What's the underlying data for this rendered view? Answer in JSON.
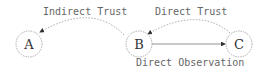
{
  "diagram": {
    "nodes": [
      {
        "id": "A",
        "label": "A"
      },
      {
        "id": "B",
        "label": "B"
      },
      {
        "id": "C",
        "label": "C"
      }
    ],
    "edges": [
      {
        "from": "B",
        "to": "A",
        "label": "Indirect Trust",
        "style": "dashed-curve"
      },
      {
        "from": "C",
        "to": "B",
        "label": "Direct Trust",
        "style": "dashed-curve"
      },
      {
        "from": "B",
        "to": "C",
        "label": "Direct Observation",
        "style": "solid"
      }
    ],
    "colors": {
      "stroke": "#777777",
      "text": "#555555"
    }
  }
}
